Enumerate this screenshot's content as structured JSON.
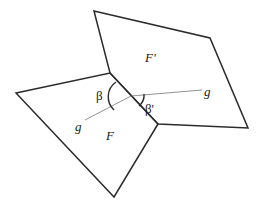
{
  "diagram": {
    "faces": [
      {
        "id": "F",
        "label": "F",
        "points": [
          [
            16,
            93
          ],
          [
            110,
            73
          ],
          [
            158,
            124
          ],
          [
            114,
            197
          ]
        ]
      },
      {
        "id": "F_prime",
        "label": "F'",
        "points": [
          [
            94,
            11
          ],
          [
            210,
            38
          ],
          [
            248,
            128
          ],
          [
            158,
            124
          ],
          [
            110,
            73
          ]
        ]
      }
    ],
    "shared_edge": [
      [
        110,
        73
      ],
      [
        158,
        124
      ]
    ],
    "geodesic": {
      "label_left": "g",
      "label_right": "g",
      "segment_in_F": [
        [
          85,
          120
        ],
        [
          131,
          96
        ]
      ],
      "segment_in_F_prime": [
        [
          131,
          96
        ],
        [
          202,
          90
        ]
      ]
    },
    "angles": {
      "beta": "β",
      "beta_prime": "β'"
    },
    "labels": {
      "face_F": "F",
      "face_F_prime": "F'",
      "g_left": "g",
      "g_right": "g",
      "beta": "β",
      "beta_prime": "β'"
    },
    "colors": {
      "edge": "#2a2a2a",
      "geodesic": "#777777",
      "background": "#ffffff"
    }
  }
}
